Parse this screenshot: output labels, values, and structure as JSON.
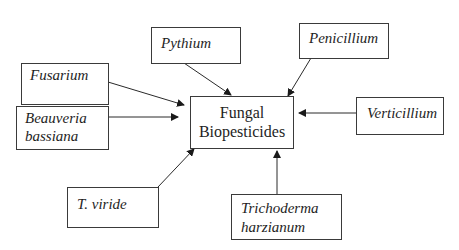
{
  "diagram": {
    "center": {
      "line1": "Fungal",
      "line2": "Biopesticides"
    },
    "sources": {
      "pythium": {
        "label": "Pythium"
      },
      "penicillium": {
        "label": "Penicillium"
      },
      "fusarium": {
        "label": "Fusarium"
      },
      "beauveria": {
        "line1": "Beauveria",
        "line2": "bassiana"
      },
      "verticillium": {
        "label": "Verticillium"
      },
      "tviride": {
        "label": "T. viride"
      },
      "trichoderma": {
        "line1": "Trichoderma",
        "line2": "harzianum"
      }
    },
    "edges": [
      {
        "from": "Pythium",
        "to": "Fungal Biopesticides"
      },
      {
        "from": "Penicillium",
        "to": "Fungal Biopesticides"
      },
      {
        "from": "Fusarium",
        "to": "Fungal Biopesticides"
      },
      {
        "from": "Beauveria bassiana",
        "to": "Fungal Biopesticides"
      },
      {
        "from": "Verticillium",
        "to": "Fungal Biopesticides"
      },
      {
        "from": "T. viride",
        "to": "Fungal Biopesticides"
      },
      {
        "from": "Trichoderma harzianum",
        "to": "Fungal Biopesticides"
      }
    ],
    "colors": {
      "line": "#2a2a2a",
      "border": "#3a3a3a",
      "text": "#1e1e1e"
    }
  }
}
